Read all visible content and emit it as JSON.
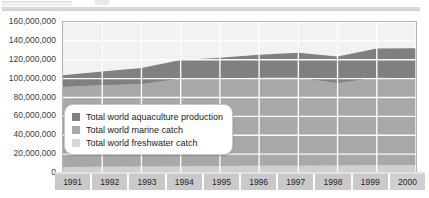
{
  "chart_data": {
    "type": "area",
    "stacked": true,
    "title": "",
    "xlabel": "",
    "ylabel": "",
    "categories": [
      "1991",
      "1992",
      "1993",
      "1994",
      "1995",
      "1996",
      "1997",
      "1998",
      "1999",
      "2000"
    ],
    "ylim": [
      0,
      160000000
    ],
    "ytick_labels": [
      "160,000,000",
      "140,000,000",
      "120,000,000",
      "100,000,000",
      "80,000,000",
      "60,000,000",
      "40,000,000",
      "20,000,000",
      "0"
    ],
    "ytick_values": [
      160000000,
      140000000,
      120000000,
      100000000,
      80000000,
      60000000,
      40000000,
      20000000,
      0
    ],
    "ytick_step": 20000000,
    "grid": true,
    "legend_position": "inside-left",
    "stack_order_bottom_to_top": [
      "Total world freshwater catch",
      "Total world marine catch",
      "Total world aquaculture production"
    ],
    "series": [
      {
        "name": "Total world freshwater catch",
        "color": "#d0d0d0",
        "values": [
          6400000,
          6600000,
          6900000,
          7100000,
          7400000,
          7600000,
          7700000,
          8000000,
          8300000,
          8600000
        ]
      },
      {
        "name": "Total world marine catch",
        "color": "#a8a8a8",
        "values": [
          84600000,
          86400000,
          87100000,
          92900000,
          92600000,
          93400000,
          93300000,
          87000000,
          92700000,
          91400000
        ]
      },
      {
        "name": "Total world aquaculture production",
        "color": "#808080",
        "values": [
          12600000,
          14600000,
          17200000,
          19800000,
          22000000,
          24400000,
          26300000,
          28400000,
          31000000,
          32200000
        ]
      }
    ],
    "totals": [
      103600000,
      107600000,
      111200000,
      119800000,
      122000000,
      125400000,
      127300000,
      123400000,
      132000000,
      132200000
    ]
  },
  "legend": {
    "items": [
      {
        "label": "Total world aquaculture production",
        "color": "#808080"
      },
      {
        "label": "Total world marine catch",
        "color": "#a8a8a8"
      },
      {
        "label": "Total world freshwater catch",
        "color": "#d8d8d8"
      }
    ]
  }
}
